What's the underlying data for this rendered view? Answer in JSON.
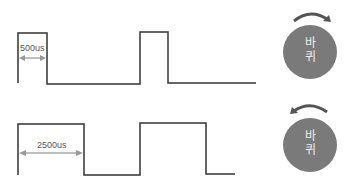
{
  "diagram": {
    "rows": [
      {
        "pulse_label": "500us",
        "rotation": "clockwise",
        "wheel_text_line1": "바",
        "wheel_text_line2": "퀴"
      },
      {
        "pulse_label": "2500us",
        "rotation": "counterclockwise",
        "wheel_text_line1": "바",
        "wheel_text_line2": "퀴"
      }
    ],
    "colors": {
      "signal_line": "#333333",
      "dimension_arrow": "#aaaaaa",
      "wheel_fill": "#7a7a7a",
      "rotation_arrow": "#555555"
    }
  }
}
